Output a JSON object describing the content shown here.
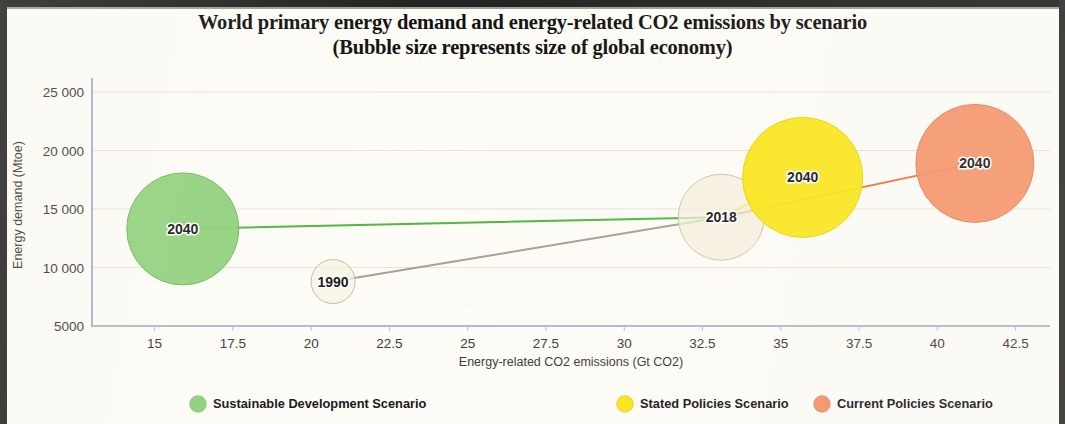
{
  "title": {
    "line1": "World primary energy demand and energy-related CO2 emissions by scenario",
    "line2": "(Bubble size represents size of global economy)"
  },
  "legend": {
    "items": [
      {
        "label": "Sustainable Development Scenario",
        "color": "#8ed17a"
      },
      {
        "label": "Stated Policies Scenario",
        "color": "#fae618"
      },
      {
        "label": "Current Policies Scenario",
        "color": "#f59268"
      }
    ]
  },
  "chart_data": {
    "type": "scatter",
    "title": "World primary energy demand and energy-related CO2 emissions by scenario (Bubble size represents size of global economy)",
    "xlabel": "Energy-related CO2 emissions (Gt CO2)",
    "ylabel": "Energy demand (Mtoe)",
    "xlim": [
      13.0,
      43.6
    ],
    "ylim": [
      5000,
      26200
    ],
    "xticks": [
      "15",
      "17.5",
      "20",
      "22.5",
      "25",
      "27.5",
      "30",
      "32.5",
      "35",
      "37.5",
      "40",
      "42.5"
    ],
    "xtick_values": [
      15,
      17.5,
      20,
      22.5,
      25,
      27.5,
      30,
      32.5,
      35,
      37.5,
      40,
      42.5
    ],
    "yticks": [
      "25 000",
      "20 000",
      "15 000",
      "10 000",
      "5000"
    ],
    "ytick_values": [
      25000,
      20000,
      15000,
      10000,
      5000
    ],
    "grid": true,
    "legend_position": "bottom",
    "size_encoding": "Bubble size represents size of global economy",
    "points": [
      {
        "label": "1990",
        "series": "Historical",
        "x": 20.7,
        "y": 8800,
        "size_px": 22,
        "fill": "#f7f2e3",
        "stroke": "#c8bda2"
      },
      {
        "label": "2018",
        "series": "Historical",
        "x": 33.1,
        "y": 14300,
        "size_px": 43,
        "fill": "#f4eedd",
        "stroke": "#cfc5ab"
      },
      {
        "label": "2040",
        "series": "Sustainable Development Scenario",
        "x": 15.9,
        "y": 13300,
        "size_px": 56,
        "fill": "#8ed17a",
        "stroke": "#6fbb59"
      },
      {
        "label": "2040",
        "series": "Stated Policies Scenario",
        "x": 35.7,
        "y": 17700,
        "size_px": 60,
        "fill": "#fae618",
        "stroke": "#ecd400"
      },
      {
        "label": "2040",
        "series": "Current Policies Scenario",
        "x": 41.2,
        "y": 18900,
        "size_px": 59,
        "fill": "#f59268",
        "stroke": "#e7815a"
      }
    ],
    "connectors": [
      {
        "name": "historical-1990-to-2018",
        "from": "1990",
        "to": "2018",
        "color": "#a9a093"
      },
      {
        "name": "sds-2018-to-2040",
        "from": "2018",
        "to": "2040 Sustainable Development Scenario",
        "color": "#4fb83a"
      },
      {
        "name": "steps-2018-to-2040",
        "from": "2018",
        "to": "2040 Stated Policies Scenario",
        "color": "#ecd400"
      },
      {
        "name": "cps-2018-to-2040",
        "from": "2018",
        "to": "2040 Current Policies Scenario",
        "color": "#f2703a"
      }
    ]
  }
}
